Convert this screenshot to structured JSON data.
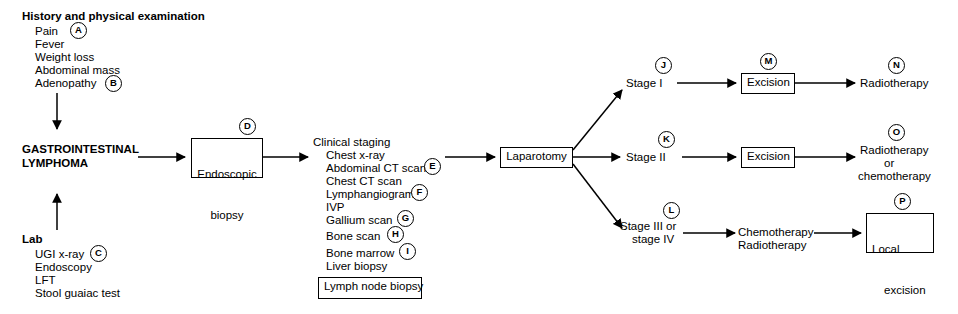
{
  "background_color": "#ffffff",
  "line_color": "#000000",
  "nodes": {
    "history_heading": "History and physical examination",
    "history_items": [
      "Pain",
      "Fever",
      "Weight loss",
      "Abdominal mass",
      "Adenopathy"
    ],
    "lab_heading": "Lab",
    "lab_items": [
      "UGI x-ray",
      "Endoscopy",
      "LFT",
      "Stool guaiac test"
    ],
    "diagnosis_line1": "GASTROINTESTINAL",
    "diagnosis_line2": "LYMPHOMA",
    "endoscopic_biopsy_line1": "Endoscopic",
    "endoscopic_biopsy_line2": "biopsy",
    "clinical_staging_heading": "Clinical staging",
    "clinical_staging_items": [
      "Chest x-ray",
      "Abdominal CT scan",
      "Chest CT scan",
      "Lymphangiogram",
      "IVP",
      "Gallium scan",
      "Bone scan",
      "Bone marrow",
      "Liver biopsy"
    ],
    "lymph_node_biopsy": "Lymph node biopsy",
    "laparotomy": "Laparotomy",
    "stage_1": "Stage I",
    "stage_2": "Stage II",
    "stage_34_line1": "Stage III or",
    "stage_34_line2": "stage IV",
    "excision_1": "Excision",
    "excision_2": "Excision",
    "chemo_radio_line1": "Chemotherapy",
    "chemo_radio_line2": "Radiotherapy",
    "radiotherapy": "Radiotherapy",
    "radio_or_chemo_line1": "Radiotherapy",
    "radio_or_chemo_line2": "or",
    "radio_or_chemo_line3": "chemotherapy",
    "local_excision_line1": "Local",
    "local_excision_line2": "excision"
  },
  "annotations": {
    "a": "A",
    "b": "B",
    "c": "C",
    "d": "D",
    "e": "E",
    "f": "F",
    "g": "G",
    "h": "H",
    "i": "I",
    "j": "J",
    "k": "K",
    "l": "L",
    "m": "M",
    "n": "N",
    "o": "O",
    "p": "P"
  }
}
